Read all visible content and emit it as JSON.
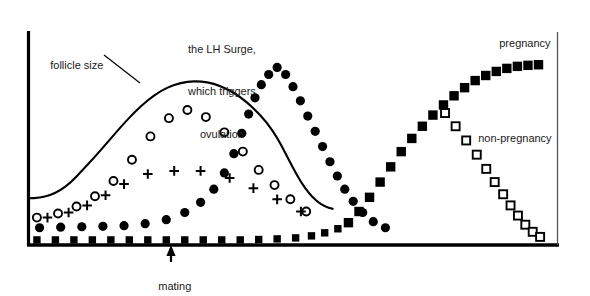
{
  "chart_data": {
    "type": "scatter",
    "title": "",
    "subtitle": "",
    "xlabel": "",
    "ylabel": "",
    "grid": false,
    "legend_position": "inline-annotations",
    "xlim": [
      0,
      100
    ],
    "ylim": [
      0,
      100
    ],
    "axes": {
      "left_axis": true,
      "bottom_axis": true,
      "right_axis": true,
      "top_axis": false,
      "tick_labels_x": [],
      "tick_labels_y": []
    },
    "annotations": [
      {
        "id": "follicle-size",
        "text": "follicle size",
        "x": 8,
        "y": 82,
        "leader_line": true
      },
      {
        "id": "lh-surge",
        "text": "the LH Surge,\nwhich triggers\novulation",
        "x": 36,
        "y": 96,
        "leader_line": false
      },
      {
        "id": "pregnancy",
        "text": "pregnancy",
        "x": 88,
        "y": 92,
        "leader_line": false
      },
      {
        "id": "non-pregnancy",
        "text": "non-pregnancy",
        "x": 84,
        "y": 48,
        "leader_line": false
      },
      {
        "id": "mating",
        "text": "mating",
        "x": 27,
        "y": -8,
        "leader_line": true,
        "arrow": "up"
      }
    ],
    "series": [
      {
        "name": "follicle size",
        "marker": "line",
        "style": "solid-curve",
        "color": "#000000",
        "points": [
          [
            0.0,
            23.0
          ],
          [
            2.0,
            23.2
          ],
          [
            4.0,
            24.5
          ],
          [
            6.0,
            27.0
          ],
          [
            8.0,
            31.0
          ],
          [
            10.0,
            36.5
          ],
          [
            12.5,
            43.5
          ],
          [
            15.0,
            51.0
          ],
          [
            17.5,
            58.5
          ],
          [
            20.0,
            65.5
          ],
          [
            22.5,
            71.5
          ],
          [
            25.0,
            76.0
          ],
          [
            27.5,
            79.0
          ],
          [
            30.0,
            80.5
          ],
          [
            32.5,
            80.7
          ],
          [
            35.0,
            79.5
          ],
          [
            37.5,
            77.0
          ],
          [
            40.0,
            73.0
          ],
          [
            42.5,
            67.5
          ],
          [
            45.0,
            60.5
          ],
          [
            47.0,
            53.0
          ],
          [
            48.5,
            45.5
          ],
          [
            50.0,
            38.0
          ],
          [
            51.5,
            31.0
          ],
          [
            53.0,
            25.5
          ],
          [
            54.5,
            21.5
          ],
          [
            56.0,
            19.0
          ],
          [
            57.5,
            17.8
          ]
        ]
      },
      {
        "name": "estrogen",
        "marker": "open-circle",
        "color": "#000000",
        "points": [
          [
            1.5,
            13.5
          ],
          [
            5.5,
            15.5
          ],
          [
            9.0,
            19.0
          ],
          [
            12.5,
            24.0
          ],
          [
            16.0,
            31.5
          ],
          [
            19.5,
            42.0
          ],
          [
            23.0,
            53.5
          ],
          [
            26.5,
            62.5
          ],
          [
            30.0,
            66.5
          ],
          [
            33.5,
            63.0
          ],
          [
            37.0,
            55.5
          ],
          [
            40.5,
            46.0
          ],
          [
            43.5,
            37.0
          ],
          [
            46.5,
            29.5
          ],
          [
            49.5,
            22.5
          ],
          [
            52.5,
            16.5
          ]
        ]
      },
      {
        "name": "FSH",
        "marker": "plus",
        "color": "#000000",
        "points": [
          [
            3.5,
            13.5
          ],
          [
            7.5,
            16.0
          ],
          [
            11.0,
            19.5
          ],
          [
            14.5,
            24.5
          ],
          [
            18.0,
            30.0
          ],
          [
            22.5,
            35.0
          ],
          [
            27.5,
            36.5
          ],
          [
            32.5,
            36.5
          ],
          [
            38.0,
            33.0
          ],
          [
            42.5,
            28.0
          ],
          [
            47.0,
            22.5
          ],
          [
            51.5,
            16.5
          ]
        ]
      },
      {
        "name": "LH",
        "marker": "filled-circle",
        "color": "#000000",
        "points": [
          [
            2.0,
            8.5
          ],
          [
            6.0,
            8.8
          ],
          [
            10.0,
            9.0
          ],
          [
            14.0,
            9.2
          ],
          [
            18.0,
            9.5
          ],
          [
            22.0,
            10.5
          ],
          [
            26.0,
            12.5
          ],
          [
            29.5,
            16.0
          ],
          [
            32.5,
            21.0
          ],
          [
            35.0,
            27.5
          ],
          [
            37.0,
            35.5
          ],
          [
            38.8,
            45.0
          ],
          [
            40.3,
            55.0
          ],
          [
            41.6,
            64.5
          ],
          [
            42.8,
            72.5
          ],
          [
            44.0,
            79.0
          ],
          [
            45.4,
            84.0
          ],
          [
            47.0,
            87.5
          ],
          [
            48.6,
            84.0
          ],
          [
            50.0,
            78.0
          ],
          [
            51.4,
            71.0
          ],
          [
            52.8,
            63.5
          ],
          [
            54.2,
            56.0
          ],
          [
            55.6,
            48.5
          ],
          [
            57.0,
            41.0
          ],
          [
            58.4,
            34.0
          ],
          [
            59.8,
            27.5
          ],
          [
            61.4,
            21.5
          ],
          [
            63.2,
            16.0
          ],
          [
            65.2,
            11.5
          ],
          [
            67.5,
            8.5
          ]
        ]
      },
      {
        "name": "progesterone baseline",
        "marker": "filled-square",
        "color": "#000000",
        "points": [
          [
            1.5,
            2.5
          ],
          [
            5.0,
            2.5
          ],
          [
            8.5,
            2.5
          ],
          [
            12.0,
            2.5
          ],
          [
            15.5,
            2.5
          ],
          [
            19.0,
            2.5
          ],
          [
            22.5,
            2.5
          ],
          [
            26.0,
            2.5
          ],
          [
            29.5,
            2.5
          ],
          [
            33.0,
            2.5
          ],
          [
            36.5,
            2.5
          ],
          [
            40.0,
            2.5
          ],
          [
            43.5,
            2.7
          ],
          [
            47.0,
            3.0
          ],
          [
            50.5,
            3.5
          ],
          [
            53.5,
            4.5
          ],
          [
            56.0,
            6.0
          ],
          [
            58.5,
            8.0
          ]
        ]
      },
      {
        "name": "pregnancy",
        "marker": "filled-square",
        "color": "#000000",
        "points": [
          [
            60.5,
            11.0
          ],
          [
            62.5,
            16.5
          ],
          [
            64.5,
            23.5
          ],
          [
            66.5,
            31.0
          ],
          [
            68.5,
            38.5
          ],
          [
            70.5,
            46.0
          ],
          [
            72.5,
            52.5
          ],
          [
            74.5,
            58.5
          ],
          [
            76.5,
            64.0
          ],
          [
            78.5,
            69.0
          ],
          [
            80.5,
            73.5
          ],
          [
            82.5,
            77.5
          ],
          [
            84.5,
            81.0
          ],
          [
            86.5,
            83.5
          ],
          [
            88.5,
            85.5
          ],
          [
            90.5,
            87.0
          ],
          [
            92.5,
            88.0
          ],
          [
            94.5,
            88.5
          ],
          [
            96.5,
            88.8
          ]
        ]
      },
      {
        "name": "non-pregnancy",
        "marker": "open-square",
        "color": "#000000",
        "points": [
          [
            78.8,
            65.0
          ],
          [
            80.8,
            58.5
          ],
          [
            82.8,
            51.5
          ],
          [
            84.8,
            44.5
          ],
          [
            86.6,
            37.5
          ],
          [
            88.2,
            31.0
          ],
          [
            89.8,
            25.0
          ],
          [
            91.2,
            19.5
          ],
          [
            92.6,
            14.5
          ],
          [
            94.0,
            10.0
          ],
          [
            95.4,
            6.5
          ],
          [
            96.8,
            4.0
          ]
        ]
      }
    ]
  },
  "labels": {
    "follicle_size": "follicle size",
    "lh_surge_line1": "the LH Surge,",
    "lh_surge_line2": "which triggers",
    "lh_surge_line3": "ovulation",
    "pregnancy": "pregnancy",
    "non_pregnancy": "non-pregnancy",
    "mating": "mating"
  },
  "colors": {
    "ink": "#000000",
    "text": "#1a1a1a",
    "background": "#ffffff"
  }
}
